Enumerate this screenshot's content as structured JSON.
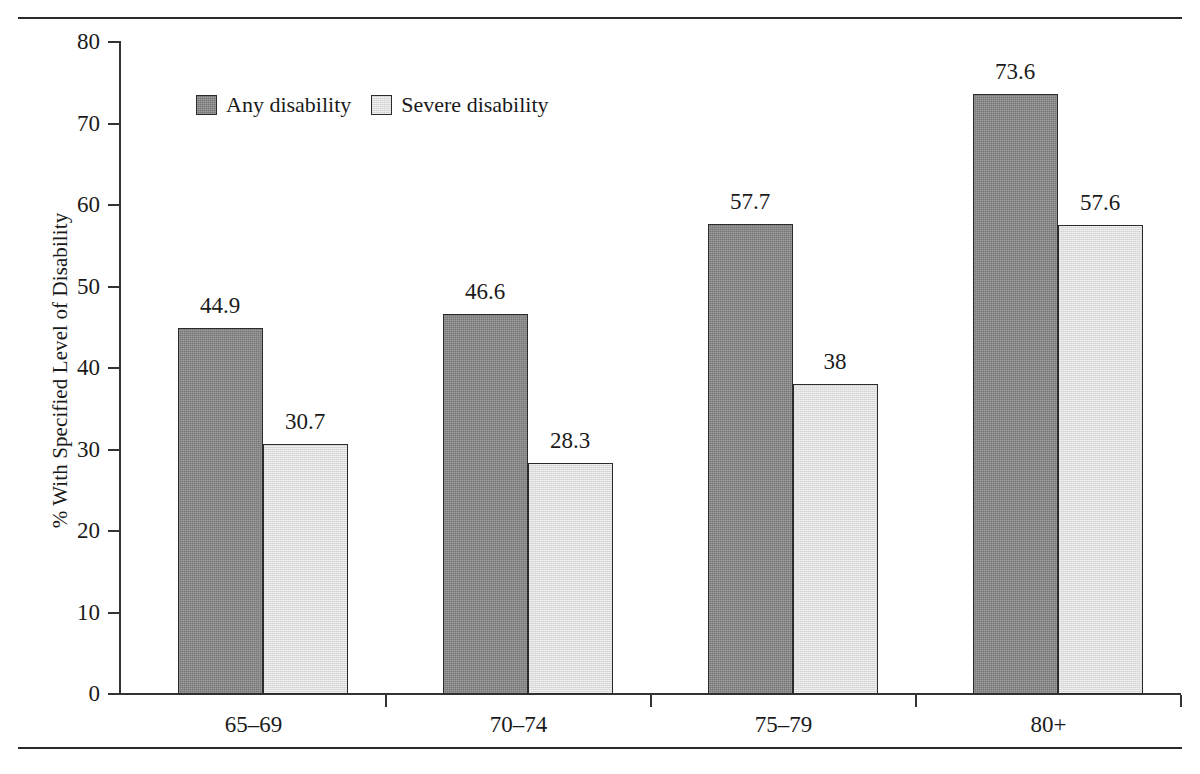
{
  "chart_data": {
    "type": "bar",
    "title": "",
    "subtitle": "",
    "xlabel": "",
    "ylabel": "% With Specified Level of Disability",
    "categories": [
      "65–69",
      "70–74",
      "75–79",
      "80+"
    ],
    "series": [
      {
        "name": "Any disability",
        "values": [
          44.9,
          46.6,
          57.7,
          73.6
        ],
        "labels": [
          "44.9",
          "46.6",
          "57.7",
          "73.6"
        ],
        "color": "#767676",
        "swatch": "dark"
      },
      {
        "name": "Severe disability",
        "values": [
          30.7,
          28.3,
          38.0,
          57.6
        ],
        "labels": [
          "30.7",
          "28.3",
          "38",
          "57.6"
        ],
        "color": "#dedede",
        "swatch": "light"
      }
    ],
    "ylim": [
      0,
      80
    ],
    "yticks": [
      0,
      10,
      20,
      30,
      40,
      50,
      60,
      70,
      80
    ],
    "ytick_labels": [
      "0",
      "10",
      "20",
      "30",
      "40",
      "50",
      "60",
      "70",
      "80"
    ],
    "grid": false,
    "legend_position": "upper-left-inside",
    "bar_outline_color": "#2b2b2b",
    "axis_color": "#333333",
    "background": "#ffffff"
  },
  "legend": {
    "items": [
      {
        "label": "Any disability",
        "swatch": "dark"
      },
      {
        "label": "Severe disability",
        "swatch": "light"
      }
    ]
  },
  "axes": {
    "y_title": "% With Specified Level of Disability"
  }
}
